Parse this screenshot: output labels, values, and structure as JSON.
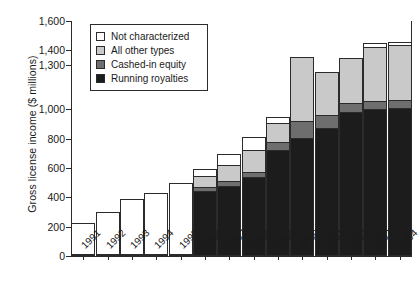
{
  "chart_data": {
    "type": "bar",
    "subtype": "stacked-bar",
    "title": "",
    "xlabel": "",
    "ylabel": "Gross license income ($ millions)",
    "ylim": [
      0,
      1600
    ],
    "yticks": [
      0,
      200,
      400,
      600,
      800,
      1000,
      1300,
      1400,
      1600
    ],
    "ytick_labels": [
      "0",
      "200",
      "400",
      "600",
      "800",
      "1,000",
      "1,300",
      "1,400",
      "1,600"
    ],
    "grid": false,
    "legend_position": "top-left",
    "categories": [
      "1991",
      "1992",
      "1993",
      "1994",
      "1995",
      "1996",
      "1997",
      "1998",
      "1999",
      "2000",
      "2001",
      "2002",
      "2003",
      "2004"
    ],
    "series": [
      {
        "name": "Running royalties",
        "color": "#1c1c1c",
        "values": [
          0,
          0,
          0,
          0,
          0,
          440,
          470,
          530,
          720,
          800,
          870,
          980,
          995,
          1000
        ]
      },
      {
        "name": "Cashed-in equity",
        "color": "#6e6e6e",
        "values": [
          0,
          0,
          0,
          0,
          0,
          30,
          35,
          40,
          55,
          115,
          85,
          60,
          55,
          55
        ]
      },
      {
        "name": "All other types",
        "color": "#c9c9c9",
        "values": [
          0,
          0,
          0,
          0,
          0,
          75,
          110,
          150,
          130,
          440,
          300,
          310,
          370,
          380
        ]
      },
      {
        "name": "Not characterized",
        "color": "#ffffff",
        "values": [
          225,
          300,
          385,
          430,
          500,
          50,
          80,
          90,
          40,
          0,
          0,
          0,
          30,
          20
        ]
      }
    ],
    "totals": [
      225,
      300,
      385,
      430,
      500,
      595,
      695,
      810,
      945,
      1355,
      1255,
      1350,
      1450,
      1455
    ]
  },
  "legend": {
    "items": [
      {
        "label": "Not characterized",
        "color": "#ffffff"
      },
      {
        "label": "All other types",
        "color": "#c9c9c9"
      },
      {
        "label": "Cashed-in equity",
        "color": "#6e6e6e"
      },
      {
        "label": "Running royalties",
        "color": "#1c1c1c"
      }
    ]
  }
}
